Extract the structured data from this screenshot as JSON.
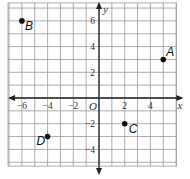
{
  "grid": {
    "x_min": -7,
    "x_max": 6,
    "y_min": -5,
    "y_max": 7,
    "step": 1,
    "line_color": "#9a9a9a",
    "axis_color": "#222222"
  },
  "axes": {
    "x_label": "x",
    "y_label": "y",
    "origin_label": "O",
    "x_ticks": [
      {
        "value": -6,
        "label": "−6"
      },
      {
        "value": -4,
        "label": "−4"
      },
      {
        "value": -2,
        "label": "−2"
      },
      {
        "value": 2,
        "label": "2"
      },
      {
        "value": 4,
        "label": "4"
      },
      {
        "value": 6,
        "label": "x"
      }
    ],
    "y_ticks": [
      {
        "value": 6,
        "label": "6"
      },
      {
        "value": 4,
        "label": "4"
      },
      {
        "value": 2,
        "label": "2"
      },
      {
        "value": -2,
        "label": "−2"
      },
      {
        "value": -4,
        "label": "−4"
      }
    ]
  },
  "points": [
    {
      "name": "A",
      "x": 5,
      "y": 3
    },
    {
      "name": "B",
      "x": -6,
      "y": 6
    },
    {
      "name": "C",
      "x": 2,
      "y": -2
    },
    {
      "name": "D",
      "x": -4,
      "y": -3
    }
  ]
}
